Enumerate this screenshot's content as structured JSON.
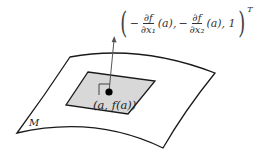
{
  "diagram": {
    "surface_label": "M",
    "point_label": "(a, f(a))",
    "normal_vector": {
      "open_paren": "(",
      "close_paren": ")",
      "sign1": "−",
      "frac1_num": "∂f",
      "frac1_den": "∂x₁",
      "arg1": "(a),",
      "sign2": "−",
      "frac2_num": "∂f",
      "frac2_den": "∂x₂",
      "arg2": "(a), 1",
      "transpose": "T"
    },
    "colors": {
      "outline": "#1a1a1a",
      "tangent_plane_fill": "#d8d8d8",
      "arrow": "#555555",
      "point": "#000000"
    }
  }
}
